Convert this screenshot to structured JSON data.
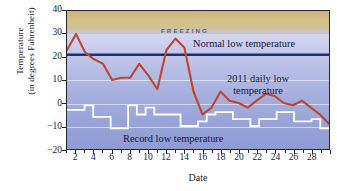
{
  "chart_data": {
    "type": "line",
    "title": "",
    "xlabel": "Date",
    "ylabel": "Temperature (in degrees Fahrenheit)",
    "ylabel_line1": "Temperature",
    "ylabel_line2": "(in degrees Fahrenheit)",
    "ylim": [
      -20,
      40
    ],
    "xlim": [
      1,
      30
    ],
    "yticks": [
      40,
      30,
      20,
      10,
      0,
      -10,
      -20
    ],
    "ytick_labels": [
      "40",
      "30",
      "20",
      "10",
      "0",
      "−10",
      "−20"
    ],
    "xticks": [
      2,
      4,
      6,
      8,
      10,
      12,
      14,
      16,
      18,
      20,
      22,
      24,
      26,
      28
    ],
    "xtick_labels": [
      "2",
      "4",
      "6",
      "8",
      "10",
      "12",
      "14",
      "16",
      "18",
      "20",
      "22",
      "24",
      "26",
      "28"
    ],
    "x": [
      1,
      2,
      3,
      4,
      5,
      6,
      7,
      8,
      9,
      10,
      11,
      12,
      13,
      14,
      15,
      16,
      17,
      18,
      19,
      20,
      21,
      22,
      23,
      24,
      25,
      26,
      27,
      28,
      29,
      30
    ],
    "grid": true,
    "legend": "in-plot annotations",
    "annotations": [
      {
        "name": "freezing",
        "text": "FREEZING",
        "value": 32
      },
      {
        "name": "normal-low",
        "text": "Normal low temperature",
        "value": 21
      },
      {
        "name": "daily-low",
        "text": "2011 daily low temperature"
      },
      {
        "name": "record-low",
        "text": "Record low temperature"
      }
    ],
    "series": [
      {
        "name": "2011 daily low temperature",
        "color": "#c0452f",
        "values": [
          23,
          30,
          22,
          19,
          17,
          10,
          11,
          11,
          17,
          12,
          6,
          23,
          28,
          24,
          5,
          -5,
          -2,
          5,
          1,
          0,
          -2,
          1,
          4,
          3,
          0,
          -1,
          1,
          -2,
          -5,
          -9
        ]
      },
      {
        "name": "Record low temperature",
        "color": "#ffffff",
        "step": true,
        "values": [
          -3,
          -3,
          -1,
          -6,
          -6,
          -11,
          -11,
          -1,
          -5,
          -2,
          -5,
          -5,
          -5,
          -10,
          -10,
          -8,
          -5,
          -4,
          -4,
          -7,
          -7,
          -10,
          -7,
          -7,
          -4,
          -4,
          -8,
          -8,
          -7,
          -11
        ]
      },
      {
        "name": "Normal low temperature",
        "color": "#18307e",
        "constant": 21
      },
      {
        "name": "Freezing band",
        "color": "#cdb478",
        "range": [
          32,
          40
        ]
      }
    ]
  },
  "figure": {
    "xaxis_title": "Date",
    "yaxis_title_line1": "Temperature",
    "yaxis_title_line2": "(in degrees Fahrenheit)"
  }
}
